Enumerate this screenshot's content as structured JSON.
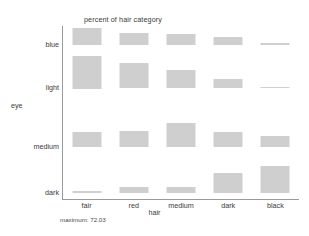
{
  "chart_data": {
    "type": "bar",
    "title": "percent of hair category",
    "xlabel": "hair",
    "ylabel": "eye",
    "footnote": "maximum: 72.03",
    "maximum": 72.03,
    "grid": false,
    "legend": "none",
    "categories": [
      "fair",
      "red",
      "medium",
      "dark",
      "black"
    ],
    "rows": [
      "blue",
      "light",
      "medium",
      "dark"
    ],
    "value_unit": "percent of hair category",
    "ylim": [
      0,
      72.03
    ],
    "series": [
      {
        "name": "blue",
        "values": [
          38.8,
          27.1,
          25.6,
          19.2,
          4.5
        ]
      },
      {
        "name": "light",
        "values": [
          72.0,
          55.8,
          40.8,
          20.4,
          4.1
        ]
      },
      {
        "name": "medium",
        "values": [
          32.9,
          35.5,
          54.0,
          33.8,
          26.0
        ]
      },
      {
        "name": "dark",
        "values": [
          5.2,
          14.0,
          15.0,
          44.2,
          61.0
        ]
      }
    ],
    "cells": [
      {
        "row": "blue",
        "col": "fair",
        "value": 38.8
      },
      {
        "row": "blue",
        "col": "red",
        "value": 27.1
      },
      {
        "row": "blue",
        "col": "medium",
        "value": 25.6
      },
      {
        "row": "blue",
        "col": "dark",
        "value": 19.2
      },
      {
        "row": "blue",
        "col": "black",
        "value": 4.5
      },
      {
        "row": "light",
        "col": "fair",
        "value": 72.03
      },
      {
        "row": "light",
        "col": "red",
        "value": 55.8
      },
      {
        "row": "light",
        "col": "medium",
        "value": 40.8
      },
      {
        "row": "light",
        "col": "dark",
        "value": 20.4
      },
      {
        "row": "light",
        "col": "black",
        "value": 4.1
      },
      {
        "row": "medium",
        "col": "fair",
        "value": 32.9
      },
      {
        "row": "medium",
        "col": "red",
        "value": 35.5
      },
      {
        "row": "medium",
        "col": "medium",
        "value": 54.0
      },
      {
        "row": "medium",
        "col": "dark",
        "value": 33.8
      },
      {
        "row": "medium",
        "col": "black",
        "value": 26.0
      },
      {
        "row": "dark",
        "col": "fair",
        "value": 5.2
      },
      {
        "row": "dark",
        "col": "red",
        "value": 14.0
      },
      {
        "row": "dark",
        "col": "medium",
        "value": 15.0
      },
      {
        "row": "dark",
        "col": "dark",
        "value": 44.2
      },
      {
        "row": "dark",
        "col": "black",
        "value": 61.0
      }
    ],
    "colors": {
      "bar_fill": "#cfcfcf",
      "axis": "#9a9a9a",
      "text": "#3a3a3a",
      "background": "#ffffff"
    }
  },
  "axis": {
    "x_title": "hair",
    "y_title": "eye",
    "x_ticks": [
      "fair",
      "red",
      "medium",
      "dark",
      "black"
    ],
    "y_ticks": [
      "blue",
      "light",
      "medium",
      "dark"
    ]
  },
  "title": "percent of hair category",
  "footnote": "maximum: 72.03"
}
